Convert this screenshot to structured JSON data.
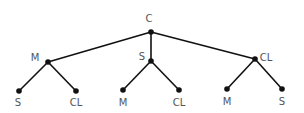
{
  "diagram": {
    "type": "tree",
    "colors": {
      "edge": "#111111",
      "node": "#111111",
      "label": "#555555",
      "background": "#ffffff"
    },
    "nodes": [
      {
        "id": "root",
        "label": "C",
        "x": 151,
        "y": 32,
        "lx": 149,
        "ly": 22,
        "anchor": "middle"
      },
      {
        "id": "m1",
        "label": "M",
        "x": 48,
        "y": 62,
        "lx": 35,
        "ly": 61,
        "anchor": "middle"
      },
      {
        "id": "s1",
        "label": "S",
        "x": 151,
        "y": 61,
        "lx": 142,
        "ly": 60,
        "anchor": "middle"
      },
      {
        "id": "cl1",
        "label": "CL",
        "x": 255,
        "y": 59,
        "lx": 266,
        "ly": 61,
        "anchor": "middle"
      },
      {
        "id": "m1_s",
        "label": "S",
        "x": 19,
        "y": 91,
        "lx": 18,
        "ly": 106,
        "anchor": "middle"
      },
      {
        "id": "m1_cl",
        "label": "CL",
        "x": 76,
        "y": 91,
        "lx": 76,
        "ly": 106,
        "anchor": "middle"
      },
      {
        "id": "s1_m",
        "label": "M",
        "x": 123,
        "y": 90,
        "lx": 123,
        "ly": 106,
        "anchor": "middle"
      },
      {
        "id": "s1_cl",
        "label": "CL",
        "x": 179,
        "y": 90,
        "lx": 179,
        "ly": 106,
        "anchor": "middle"
      },
      {
        "id": "cl1_m",
        "label": "M",
        "x": 227,
        "y": 89,
        "lx": 227,
        "ly": 105,
        "anchor": "middle"
      },
      {
        "id": "cl1_s",
        "label": "S",
        "x": 282,
        "y": 89,
        "lx": 282,
        "ly": 105,
        "anchor": "middle"
      }
    ],
    "edges": [
      [
        "root",
        "m1"
      ],
      [
        "root",
        "s1"
      ],
      [
        "root",
        "cl1"
      ],
      [
        "m1",
        "m1_s"
      ],
      [
        "m1",
        "m1_cl"
      ],
      [
        "s1",
        "s1_m"
      ],
      [
        "s1",
        "s1_cl"
      ],
      [
        "cl1",
        "cl1_m"
      ],
      [
        "cl1",
        "cl1_s"
      ]
    ]
  }
}
